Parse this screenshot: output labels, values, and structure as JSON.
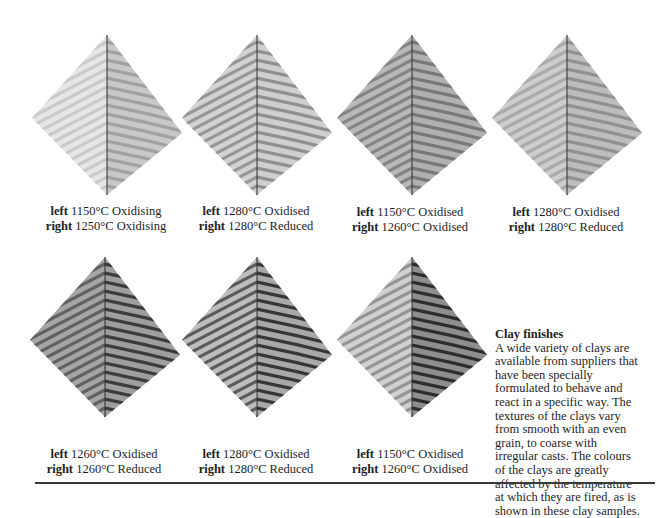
{
  "samples": [
    {
      "left_label": "left",
      "left_text": "1150°C Oxidising",
      "right_label": "right",
      "right_text": "1250°C Oxidising",
      "left_tone": "#e6e6e6",
      "left_stripe": "#c4c4c4",
      "right_tone": "#c8c8c8",
      "right_stripe": "#9a9a9a"
    },
    {
      "left_label": "left",
      "left_text": "1280°C Oxidised",
      "right_label": "right",
      "right_text": "1280°C Reduced",
      "left_tone": "#d2d2d2",
      "left_stripe": "#8c8c8c",
      "right_tone": "#cfcfcf",
      "right_stripe": "#858585"
    },
    {
      "left_label": "left",
      "left_text": "1150°C Oxidised",
      "right_label": "right",
      "right_text": "1260°C Oxidised",
      "left_tone": "#b8b8b8",
      "left_stripe": "#7a7a7a",
      "right_tone": "#b0b0b0",
      "right_stripe": "#6e6e6e"
    },
    {
      "left_label": "left",
      "left_text": "1280°C Oxidised",
      "right_label": "right",
      "right_text": "1280°C Reduced",
      "left_tone": "#cdcdcd",
      "left_stripe": "#a3a3a3",
      "right_tone": "#bdbdbd",
      "right_stripe": "#8a8a8a"
    },
    {
      "left_label": "left",
      "left_text": "1260°C Oxidised",
      "right_label": "right",
      "right_text": "1260°C Reduced",
      "left_tone": "#a5a5a5",
      "left_stripe": "#555555",
      "right_tone": "#9e9e9e",
      "right_stripe": "#2a2a2a"
    },
    {
      "left_label": "left",
      "left_text": "1280°C Oxidised",
      "right_label": "right",
      "right_text": "1280°C Reduced",
      "left_tone": "#bdbdbd",
      "left_stripe": "#4a4a4a",
      "right_tone": "#a8a8a8",
      "right_stripe": "#222222"
    },
    {
      "left_label": "left",
      "left_text": "1150°C Oxidised",
      "right_label": "right",
      "right_text": "1260°C Oxidised",
      "left_tone": "#d0d0d0",
      "left_stripe": "#8a8a8a",
      "right_tone": "#8e8e8e",
      "right_stripe": "#1c1c1c"
    }
  ],
  "sidebar": {
    "title": "Clay finishes",
    "lines": [
      "A wide variety of clays are",
      "available from suppliers that",
      "have been specially",
      "formulated to behave and",
      "react in a specific way. The",
      "textures of the clays vary",
      "from smooth with an even",
      "grain, to coarse with",
      "irregular casts. The colours",
      "of the clays are greatly",
      "affected by the temperature",
      "at which they are fired, as is",
      "shown in these clay samples."
    ]
  }
}
